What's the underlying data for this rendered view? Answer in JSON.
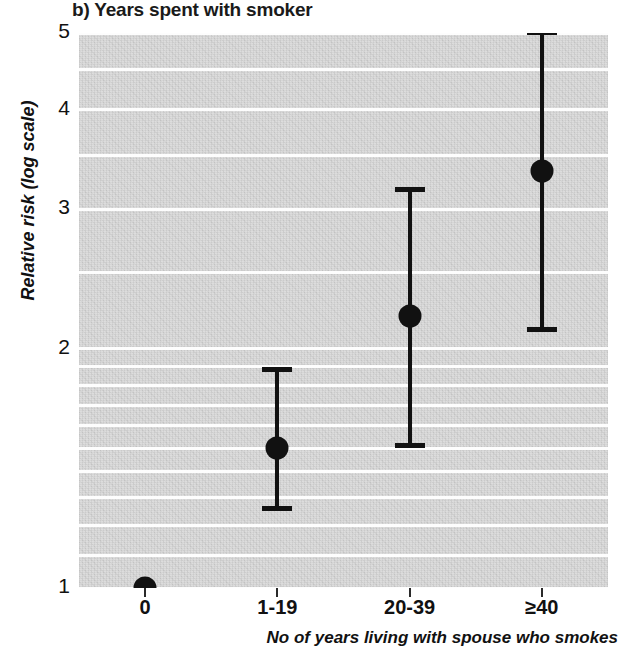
{
  "chart_data": {
    "type": "scatter",
    "title": "b) Years spent with smoker",
    "xlabel": "No of years living with spouse who smokes",
    "ylabel": "Relative risk (log scale)",
    "yscale": "log",
    "ylim": [
      1,
      5.2
    ],
    "ytick_labels": [
      "5",
      "4",
      "3",
      "2",
      "1"
    ],
    "ytick_values": [
      5,
      4,
      3,
      2,
      1
    ],
    "categories": [
      "0",
      "1-19",
      "20-39",
      "≥40"
    ],
    "values": [
      1.0,
      1.5,
      2.2,
      3.35
    ],
    "ci_low": [
      null,
      1.25,
      1.5,
      2.1
    ],
    "ci_high": [
      null,
      1.9,
      3.2,
      5.05
    ],
    "grid": true,
    "legend": "none",
    "points": [
      {
        "category": "0",
        "estimate": 1.0,
        "lower": null,
        "upper": null
      },
      {
        "category": "1-19",
        "estimate": 1.5,
        "lower": 1.25,
        "upper": 1.9
      },
      {
        "category": "20-39",
        "estimate": 2.2,
        "lower": 1.5,
        "upper": 3.2
      },
      {
        "category": "≥40",
        "estimate": 3.35,
        "lower": 2.1,
        "upper": 5.05
      }
    ],
    "colors": {
      "marker": "#111111",
      "errorbar": "#111111",
      "panel_background": "#d2d2d2",
      "gridline": "#fdfdfd",
      "text": "#111111"
    }
  },
  "figure": {
    "panel_label": "b)",
    "panel_title": "b) Years spent with smoker"
  },
  "axes": {
    "y_title": "Relative risk (log scale)",
    "x_title": "No of years living with spouse who smokes",
    "y_ticks": [
      {
        "label": "5",
        "value": 5
      },
      {
        "label": "4",
        "value": 4
      },
      {
        "label": "3",
        "value": 3
      },
      {
        "label": "2",
        "value": 2
      },
      {
        "label": "1",
        "value": 1
      }
    ],
    "x_ticks": [
      {
        "label": "0"
      },
      {
        "label": "1-19"
      },
      {
        "label": "20-39"
      },
      {
        "label": "≥40"
      }
    ]
  }
}
